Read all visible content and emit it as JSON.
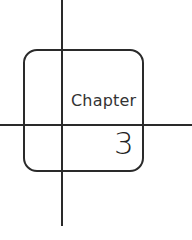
{
  "chapter_badge": {
    "label": "Chapter",
    "number": "3"
  },
  "colors": {
    "stroke": "#2a2a2a",
    "text": "#333333",
    "background": "#ffffff"
  }
}
